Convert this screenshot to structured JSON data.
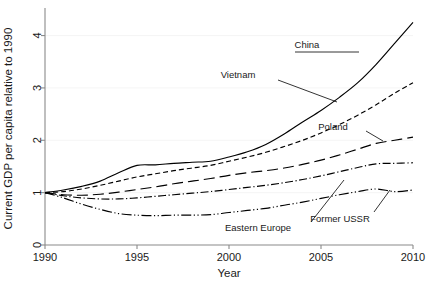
{
  "chart_data": {
    "type": "line",
    "title": "",
    "xlabel": "Year",
    "ylabel": "Current GDP per capita relative to 1990",
    "xlim": [
      1990,
      2010
    ],
    "ylim": [
      0,
      4.45
    ],
    "xticks": [
      "1990",
      "1995",
      "2000",
      "2005",
      "2010"
    ],
    "xtick_values": [
      1990,
      1995,
      2000,
      2005,
      2010
    ],
    "yticks": [
      "0",
      "1",
      "2",
      "3",
      "4"
    ],
    "ytick_values": [
      0,
      1,
      2,
      3,
      4
    ],
    "grid": "faint-horizontal",
    "legend": "inline-annotations",
    "x": [
      1990,
      1991,
      1992,
      1993,
      1994,
      1995,
      1996,
      1997,
      1998,
      1999,
      2000,
      2001,
      2002,
      2003,
      2004,
      2005,
      2006,
      2007,
      2008,
      2009,
      2010
    ],
    "series": [
      {
        "name": "China",
        "linestyle": "solid",
        "dasharray": "",
        "values": [
          1.0,
          1.05,
          1.12,
          1.22,
          1.38,
          1.52,
          1.53,
          1.56,
          1.58,
          1.6,
          1.68,
          1.78,
          1.92,
          2.12,
          2.35,
          2.57,
          2.82,
          3.1,
          3.45,
          3.85,
          4.25
        ]
      },
      {
        "name": "Vietnam",
        "linestyle": "short-dash",
        "dasharray": "5,3",
        "values": [
          1.0,
          1.02,
          1.07,
          1.14,
          1.22,
          1.3,
          1.36,
          1.42,
          1.47,
          1.52,
          1.6,
          1.68,
          1.77,
          1.88,
          2.0,
          2.14,
          2.3,
          2.48,
          2.68,
          2.9,
          3.1
        ]
      },
      {
        "name": "Poland",
        "linestyle": "long-dash",
        "dasharray": "11,5",
        "values": [
          1.0,
          0.96,
          0.95,
          0.97,
          1.01,
          1.06,
          1.11,
          1.17,
          1.22,
          1.27,
          1.33,
          1.38,
          1.42,
          1.47,
          1.54,
          1.62,
          1.72,
          1.83,
          1.94,
          2.0,
          2.06
        ]
      },
      {
        "name": "Eastern Europe",
        "linestyle": "dash-dot",
        "dasharray": "8,2.5,1.2,2.5",
        "values": [
          1.0,
          0.94,
          0.9,
          0.88,
          0.88,
          0.9,
          0.93,
          0.96,
          0.99,
          1.02,
          1.06,
          1.1,
          1.14,
          1.19,
          1.25,
          1.32,
          1.4,
          1.48,
          1.55,
          1.56,
          1.57
        ]
      },
      {
        "name": "Former USSR",
        "linestyle": "long-dash-dot-dot",
        "dasharray": "10,2.5,1.2,2.5,1.2,2.5",
        "values": [
          1.0,
          0.9,
          0.78,
          0.68,
          0.6,
          0.57,
          0.56,
          0.57,
          0.57,
          0.58,
          0.62,
          0.66,
          0.7,
          0.76,
          0.82,
          0.89,
          0.96,
          1.02,
          1.07,
          1.02,
          1.05
        ]
      }
    ],
    "annotations": [
      {
        "label": "China",
        "label_x": 307,
        "label_y": 48,
        "leader": [
          [
            295,
            52
          ],
          [
            359,
            52
          ]
        ]
      },
      {
        "label": "Vietnam",
        "label_x": 238,
        "label_y": 78,
        "leader": [
          [
            278,
            80
          ],
          [
            337,
            102
          ]
        ]
      },
      {
        "label": "Poland",
        "label_x": 333,
        "label_y": 130,
        "leader": [
          [
            366,
            131
          ],
          [
            383,
            141
          ]
        ]
      },
      {
        "label": "Eastern Europe",
        "label_x": 258,
        "label_y": 231,
        "leader": [
          [
            311,
            222
          ],
          [
            344,
            180
          ]
        ]
      },
      {
        "label": "Former USSR",
        "label_x": 340,
        "label_y": 222,
        "leader": [
          [
            374,
            212
          ],
          [
            390,
            190
          ]
        ]
      }
    ]
  },
  "axes": {
    "x_title": "Year",
    "y_title": "Current GDP per capita relative to 1990"
  }
}
